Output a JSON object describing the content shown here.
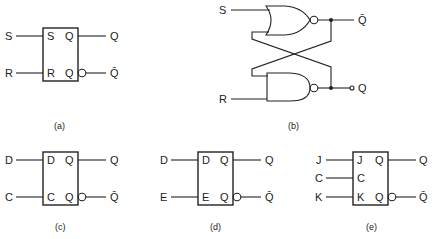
{
  "figures": {
    "a": {
      "caption": "(a)",
      "type": "SR flip-flop block",
      "inputs": [
        "S",
        "R"
      ],
      "pins_left": [
        "S",
        "R"
      ],
      "pins_right": [
        "Q",
        "Q"
      ],
      "outputs": [
        "Q",
        "Q̄"
      ]
    },
    "b": {
      "caption": "(b)",
      "type": "SR latch with cross-coupled NOR gates",
      "inputs": [
        "S",
        "R"
      ],
      "outputs": [
        "Q̄",
        "Q"
      ]
    },
    "c": {
      "caption": "(c)",
      "type": "D flip-flop block",
      "inputs": [
        "D",
        "C"
      ],
      "pins_left": [
        "D",
        "C"
      ],
      "pins_right": [
        "Q",
        "Q"
      ],
      "outputs": [
        "Q",
        "Q̄"
      ]
    },
    "d": {
      "caption": "(d)",
      "type": "D latch with enable",
      "inputs": [
        "D",
        "E"
      ],
      "pins_left": [
        "D",
        "E"
      ],
      "pins_right": [
        "Q",
        "Q"
      ],
      "outputs": [
        "Q",
        "Q̄"
      ]
    },
    "e": {
      "caption": "(e)",
      "type": "JK flip-flop block",
      "inputs": [
        "J",
        "C",
        "K"
      ],
      "pins_left": [
        "J",
        "C",
        "K"
      ],
      "pins_right": [
        "Q",
        "Q"
      ],
      "outputs": [
        "Q",
        "Q̄"
      ]
    }
  },
  "colors": {
    "line": "#222222",
    "background": "#ffffff"
  }
}
